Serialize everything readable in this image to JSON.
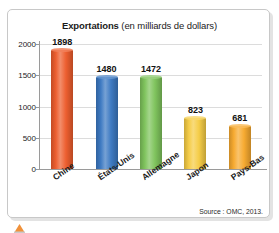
{
  "chart_data": {
    "type": "bar",
    "title": "Exportations (en milliards de dollars)",
    "title_main": "Exportations",
    "title_sub": " (en milliards de dollars)",
    "categories": [
      "Chine",
      "États-Unis",
      "Allemagne",
      "Japon",
      "Pays-Bas"
    ],
    "values": [
      1898,
      1480,
      1472,
      823,
      681
    ],
    "value_labels": [
      "1898",
      "1480",
      "1472",
      "823",
      "681"
    ],
    "series": [
      {
        "name": "Exportations",
        "values": [
          1898,
          1480,
          1472,
          823,
          681
        ]
      }
    ],
    "colors": [
      "#ED5C2C",
      "#3B78C2",
      "#7DC35B",
      "#F5CC44",
      "#F7A92E"
    ],
    "xlabel": "",
    "ylabel": "",
    "ylim": [
      0,
      2000
    ],
    "yticks": [
      0,
      500,
      1000,
      1500,
      2000
    ],
    "ytick_labels": [
      "0",
      "500",
      "1000",
      "1500",
      "2000"
    ],
    "grid": true,
    "legend": false,
    "unit": "milliards de dollars",
    "source": "Source : OMC, 2013."
  },
  "figure": {
    "source_note": "Source : OMC, 2013."
  }
}
